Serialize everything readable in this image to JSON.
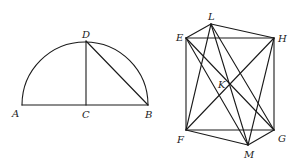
{
  "figure_left": {
    "name": "semicircle",
    "points": {
      "A": {
        "label": "A",
        "x": 22,
        "y": 105,
        "lx": 12,
        "ly": 117
      },
      "C": {
        "label": "C",
        "x": 86,
        "y": 105,
        "lx": 82,
        "ly": 118
      },
      "B": {
        "label": "B",
        "x": 148,
        "y": 105,
        "lx": 145,
        "ly": 118
      },
      "D": {
        "label": "D",
        "x": 86,
        "y": 41,
        "lx": 82,
        "ly": 38
      }
    },
    "segments": [
      [
        "A",
        "B"
      ],
      [
        "C",
        "D"
      ],
      [
        "D",
        "B"
      ]
    ],
    "arc": {
      "from": "A",
      "to": "B",
      "center": "C",
      "radius": 63
    }
  },
  "figure_right": {
    "name": "rectangle-with-diagonals",
    "points": {
      "E": {
        "label": "E",
        "x": 186,
        "y": 38,
        "lx": 176,
        "ly": 41
      },
      "H": {
        "label": "H",
        "x": 274,
        "y": 38,
        "lx": 278,
        "ly": 42
      },
      "F": {
        "label": "F",
        "x": 186,
        "y": 130,
        "lx": 177,
        "ly": 143
      },
      "G": {
        "label": "G",
        "x": 274,
        "y": 130,
        "lx": 278,
        "ly": 142
      },
      "L": {
        "label": "L",
        "x": 211,
        "y": 24,
        "lx": 208,
        "ly": 20
      },
      "M": {
        "label": "M",
        "x": 248,
        "y": 145,
        "lx": 244,
        "ly": 158
      },
      "K": {
        "label": "K",
        "x": 229,
        "y": 84,
        "lx": 218,
        "ly": 88
      }
    },
    "segments": [
      [
        "E",
        "L"
      ],
      [
        "L",
        "H"
      ],
      [
        "E",
        "H"
      ],
      [
        "E",
        "F"
      ],
      [
        "H",
        "G"
      ],
      [
        "F",
        "G"
      ],
      [
        "F",
        "M"
      ],
      [
        "M",
        "G"
      ],
      [
        "L",
        "F"
      ],
      [
        "L",
        "M"
      ],
      [
        "L",
        "G"
      ],
      [
        "E",
        "M"
      ],
      [
        "E",
        "G"
      ],
      [
        "H",
        "F"
      ],
      [
        "H",
        "M"
      ]
    ]
  }
}
